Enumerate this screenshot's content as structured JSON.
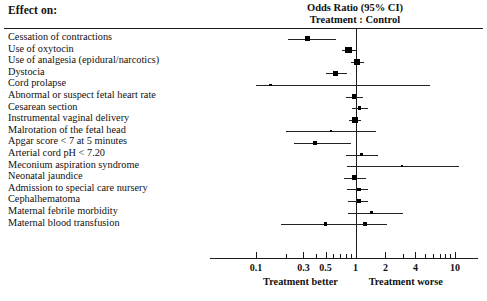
{
  "header": {
    "left_title": "Effect on:",
    "right_title_line1": "Odds Ratio (95% CI)",
    "right_title_line2": "Treatment : Control"
  },
  "axis": {
    "tick_labels": [
      "0.1",
      "0.3",
      "0.5",
      "1",
      "2",
      "4",
      "10"
    ],
    "tick_values": [
      0.1,
      0.3,
      0.5,
      1,
      2,
      4,
      10
    ],
    "minor_ticks": [
      0.2,
      0.4,
      0.6,
      0.7,
      0.8,
      0.9,
      3,
      5,
      6,
      7,
      8,
      9
    ],
    "reference_value": 1,
    "left_caption": "Treatment better",
    "right_caption": "Treatment worse",
    "scale": "log",
    "xmin": 0.09,
    "xmax": 12
  },
  "chart_data": {
    "type": "scatter",
    "title": "Odds Ratio (95% CI) Treatment : Control",
    "subtitle": "Effect on:",
    "xlabel": "Odds Ratio (95% CI)",
    "ylabel": "Effect on:",
    "xscale": "log",
    "xlim": [
      0.09,
      12
    ],
    "grid": false,
    "reference_line": 1,
    "legend": "none",
    "categories": [
      "Cessation of contractions",
      "Use of oxytocin",
      "Use of analgesia (epidural/narcotics)",
      "Dystocia",
      "Cord prolapse",
      "Abnormal or suspect fetal heart rate",
      "Cesarean section",
      "Instrumental vaginal delivery",
      "Malrotation of the fetal head",
      "Apgar score < 7 at 5 minutes",
      "Arterial cord pH < 7.20",
      "Meconium aspiration syndrome",
      "Neonatal jaundice",
      "Admission to special care nursery",
      "Cephalhematoma",
      "Maternal febrile morbidity",
      "Maternal blood transfusion"
    ],
    "points": [
      {
        "label": "Cessation of contractions",
        "or": 0.33,
        "lo": 0.21,
        "hi": 0.63,
        "size": "medium"
      },
      {
        "label": "Use of oxytocin",
        "or": 0.85,
        "lo": 0.74,
        "hi": 1.02,
        "size": "large"
      },
      {
        "label": "Use of analgesia (epidural/narcotics)",
        "or": 1.04,
        "lo": 0.91,
        "hi": 1.22,
        "size": "large"
      },
      {
        "label": "Dystocia",
        "or": 0.63,
        "lo": 0.5,
        "hi": 0.83,
        "size": "medium"
      },
      {
        "label": "Cord prolapse",
        "or": 0.14,
        "lo": 0.1,
        "hi": 5.6,
        "size": "tiny"
      },
      {
        "label": "Abnormal or suspect fetal heart rate",
        "or": 0.97,
        "lo": 0.8,
        "hi": 1.2,
        "size": "medium"
      },
      {
        "label": "Cesarean section",
        "or": 1.1,
        "lo": 0.92,
        "hi": 1.33,
        "size": "small"
      },
      {
        "label": "Instrumental vaginal delivery",
        "or": 0.98,
        "lo": 0.86,
        "hi": 1.14,
        "size": "large"
      },
      {
        "label": "Malrotation of the fetal head",
        "or": 0.57,
        "lo": 0.2,
        "hi": 1.6,
        "size": "tiny"
      },
      {
        "label": "Apgar score < 7 at 5 minutes",
        "or": 0.39,
        "lo": 0.24,
        "hi": 0.9,
        "size": "medium"
      },
      {
        "label": "Arterial cord pH < 7.20",
        "or": 1.15,
        "lo": 0.8,
        "hi": 1.7,
        "size": "small"
      },
      {
        "label": "Meconium aspiration syndrome",
        "or": 2.95,
        "lo": 0.83,
        "hi": 11.0,
        "size": "tiny"
      },
      {
        "label": "Neonatal jaundice",
        "or": 0.98,
        "lo": 0.76,
        "hi": 1.27,
        "size": "medium"
      },
      {
        "label": "Admission to special care nursery",
        "or": 1.08,
        "lo": 0.83,
        "hi": 1.35,
        "size": "small"
      },
      {
        "label": "Cephalhematoma",
        "or": 1.08,
        "lo": 0.85,
        "hi": 1.33,
        "size": "small"
      },
      {
        "label": "Maternal febrile morbidity",
        "or": 1.45,
        "lo": 0.85,
        "hi": 3.0,
        "size": "tiny"
      },
      {
        "label": "Maternal blood transfusion",
        "or": 1.25,
        "lo": 0.69,
        "hi": 2.05,
        "size": "small"
      },
      {
        "label": "Maternal blood transfusion (lower)",
        "or": 0.5,
        "lo": 0.18,
        "hi": 1.25,
        "size": "small"
      }
    ]
  }
}
